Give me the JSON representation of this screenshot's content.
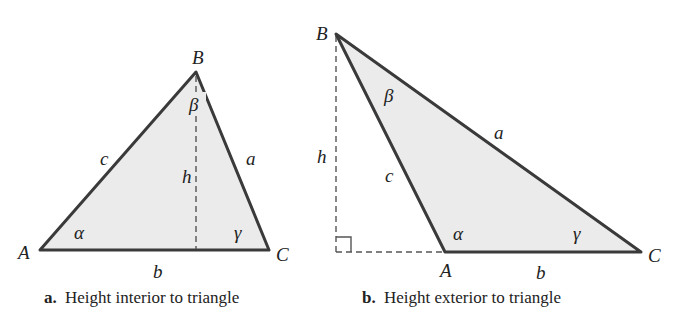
{
  "figure_a": {
    "caption_prefix": "a.",
    "caption": "Height interior to triangle",
    "vertices": {
      "A": "A",
      "B": "B",
      "C": "C"
    },
    "sides": {
      "a": "a",
      "b": "b",
      "c": "c"
    },
    "angles": {
      "alpha": "α",
      "beta": "β",
      "gamma": "γ"
    },
    "height": "h"
  },
  "figure_b": {
    "caption_prefix": "b.",
    "caption": "Height exterior to triangle",
    "vertices": {
      "A": "A",
      "B": "B",
      "C": "C"
    },
    "sides": {
      "a": "a",
      "b": "b",
      "c": "c"
    },
    "angles": {
      "alpha": "α",
      "beta": "β",
      "gamma": "γ"
    },
    "height": "h"
  },
  "colors": {
    "fill": "#ebebeb",
    "stroke": "#3a3a3a",
    "dashed": "#555555"
  }
}
